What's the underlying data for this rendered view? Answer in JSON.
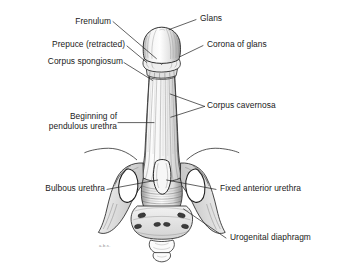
{
  "figure": {
    "background_color": "#ffffff",
    "ink_color": "#1a1a1a",
    "leader_color": "#222222",
    "signature": "a.b.s."
  },
  "labels": {
    "frenulum": "Frenulum",
    "prepuce": "Prepuce (retracted)",
    "corpus_spongiosum": "Corpus spongiosum",
    "pendulous_line1": "Beginning of",
    "pendulous_line2": "pendulous urethra",
    "bulbous_urethra": "Bulbous urethra",
    "glans": "Glans",
    "corona_of_glans": "Corona of glans",
    "corpus_cavernosa": "Corpus cavernosa",
    "fixed_anterior_urethra": "Fixed anterior urethra",
    "urogenital_diaphragm": "Urogenital diaphragm"
  },
  "structures": [
    "glans",
    "corona-of-glans",
    "frenulum",
    "retracted-prepuce",
    "corpus-spongiosum",
    "corpus-cavernosa",
    "penile-shaft",
    "bulbous-urethra",
    "fixed-anterior-urethra",
    "urogenital-diaphragm",
    "pelvic-bone",
    "obturator-foramen-left",
    "obturator-foramen-right",
    "sacrum",
    "coccyx"
  ]
}
